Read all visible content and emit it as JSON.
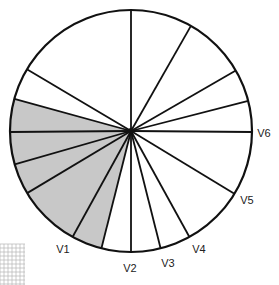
{
  "diagram": {
    "type": "precordial-lead-circle",
    "center": [
      131,
      131
    ],
    "radius": 121,
    "colors": {
      "stroke": "#111111",
      "shade": "#c8c8c8",
      "background": "#ffffff",
      "grid": "#b5b5b5"
    },
    "spoke_endpoints": [
      [
        131,
        8
      ],
      [
        192,
        24
      ],
      [
        235,
        71
      ],
      [
        248,
        101
      ],
      [
        252,
        132
      ],
      [
        233,
        193
      ],
      [
        190,
        238
      ],
      [
        161,
        250
      ],
      [
        131,
        253
      ],
      [
        101,
        250
      ],
      [
        72,
        238
      ],
      [
        29,
        192
      ],
      [
        16,
        164
      ],
      [
        12,
        132
      ],
      [
        15,
        99
      ],
      [
        28,
        70
      ]
    ],
    "shaded_range": {
      "from_index": 9,
      "to_index": 14,
      "note": "wedge from spoke at (101,250) clockwise through V1 up to spoke at (15,99)"
    },
    "labels": [
      {
        "text": "V1",
        "x": 63,
        "y": 249
      },
      {
        "text": "V2",
        "x": 130,
        "y": 268
      },
      {
        "text": "V3",
        "x": 168,
        "y": 263
      },
      {
        "text": "V4",
        "x": 199,
        "y": 249
      },
      {
        "text": "V5",
        "x": 247,
        "y": 200
      },
      {
        "text": "V6",
        "x": 264,
        "y": 133
      }
    ],
    "grid": {
      "x": 0,
      "y": 244,
      "width": 25,
      "height": 41,
      "spacing": 4
    }
  }
}
